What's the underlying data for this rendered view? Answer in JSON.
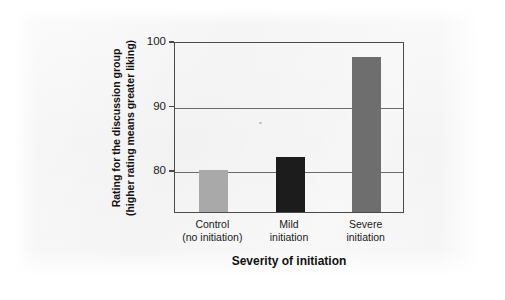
{
  "chart_data": {
    "type": "bar",
    "title": "",
    "subtitle": "",
    "xlabel": "Severity of initiation",
    "ylabel": "Rating for the discussion group (higher rating means greater liking)",
    "ylabel_line1": "Rating for the discussion group",
    "ylabel_line2": "(higher rating means greater liking)",
    "categories": [
      "Control (no initiation)",
      "Mild initiation",
      "Severe initiation"
    ],
    "category_lines": [
      [
        "Control",
        "(no initiation)"
      ],
      [
        "Mild",
        "initiation"
      ],
      [
        "Severe",
        "initiation"
      ]
    ],
    "values": [
      80.0,
      82.0,
      97.5
    ],
    "ylim": [
      73.5,
      100
    ],
    "yticks": [
      80,
      90,
      100
    ],
    "ytick_labels": [
      "80",
      "90",
      "100"
    ],
    "grid": "horizontal-gridlines-at-90-and-80",
    "legend": "none",
    "bar_colors": [
      "#a9a9a9",
      "#1c1c1c",
      "#6e6e6e"
    ],
    "axis_color": "#4a4a4a",
    "gridline_color": "#6a6a6a",
    "page_background": "#f2f2f2",
    "canvas_background": "#ffffff"
  }
}
